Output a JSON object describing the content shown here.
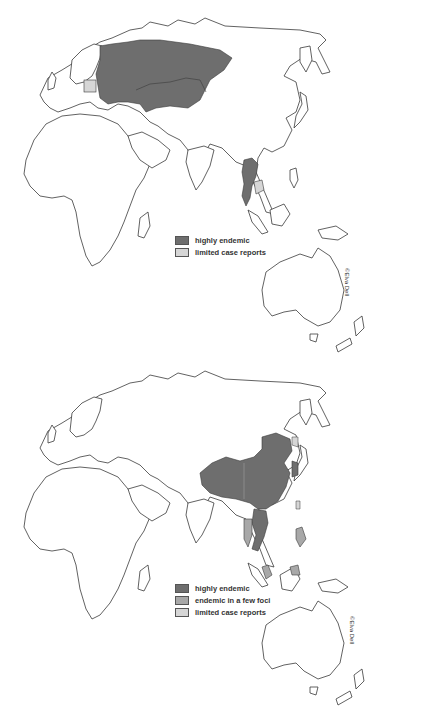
{
  "maps": [
    {
      "id": "top",
      "legend": {
        "items": [
          {
            "label": "highly endemic",
            "color": "#6e6e6e"
          },
          {
            "label": "limited case reports",
            "color": "#d6d6d6"
          }
        ]
      },
      "credit": "©Elva Dell",
      "highlighted_regions": [
        {
          "region": "Russia (European & western Siberia)",
          "category": "highly endemic"
        },
        {
          "region": "Belarus",
          "category": "highly endemic"
        },
        {
          "region": "Ukraine",
          "category": "highly endemic"
        },
        {
          "region": "Kazakhstan",
          "category": "highly endemic"
        },
        {
          "region": "Poland",
          "category": "limited case reports"
        },
        {
          "region": "Thailand",
          "category": "highly endemic"
        },
        {
          "region": "Laos",
          "category": "highly endemic"
        },
        {
          "region": "Cambodia",
          "category": "limited case reports"
        }
      ]
    },
    {
      "id": "bottom",
      "legend": {
        "items": [
          {
            "label": "highly endemic",
            "color": "#6e6e6e"
          },
          {
            "label": "endemic in a few foci",
            "color": "#a8a8a8"
          },
          {
            "label": "limited case reports",
            "color": "#d6d6d6"
          }
        ]
      },
      "credit": "©Elva Dell",
      "highlighted_regions": [
        {
          "region": "China",
          "category": "highly endemic"
        },
        {
          "region": "North Korea",
          "category": "highly endemic"
        },
        {
          "region": "South Korea",
          "category": "highly endemic"
        },
        {
          "region": "Vietnam",
          "category": "highly endemic"
        },
        {
          "region": "Laos",
          "category": "highly endemic"
        },
        {
          "region": "Thailand",
          "category": "endemic in a few foci"
        },
        {
          "region": "Philippines",
          "category": "endemic in a few foci"
        },
        {
          "region": "Malaysia (peninsular)",
          "category": "endemic in a few foci"
        },
        {
          "region": "Borneo (Sabah)",
          "category": "endemic in a few foci"
        },
        {
          "region": "Russian Far East (Primorye)",
          "category": "limited case reports"
        },
        {
          "region": "Taiwan",
          "category": "limited case reports"
        }
      ]
    }
  ]
}
